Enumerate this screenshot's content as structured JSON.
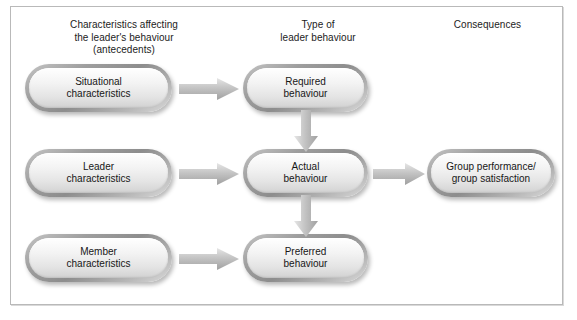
{
  "diagram": {
    "columns": [
      {
        "id": "antecedents",
        "label": "Characteristics affecting\nthe leader's behaviour\n(antecedents)"
      },
      {
        "id": "behaviour",
        "label": "Type of\nleader behaviour"
      },
      {
        "id": "consequences",
        "label": "Consequences"
      }
    ],
    "nodes": [
      {
        "id": "situational",
        "label": "Situational\ncharacteristics"
      },
      {
        "id": "leader",
        "label": "Leader\ncharacteristics"
      },
      {
        "id": "member",
        "label": "Member\ncharacteristics"
      },
      {
        "id": "required",
        "label": "Required\nbehaviour"
      },
      {
        "id": "actual",
        "label": "Actual\nbehaviour"
      },
      {
        "id": "preferred",
        "label": "Preferred\nbehaviour"
      },
      {
        "id": "group",
        "label": "Group performance/\ngroup satisfaction"
      }
    ],
    "arrows": [
      {
        "id": "situational-required",
        "from": "situational",
        "to": "required",
        "direction": "right"
      },
      {
        "id": "leader-actual",
        "from": "leader",
        "to": "actual",
        "direction": "right"
      },
      {
        "id": "member-preferred",
        "from": "member",
        "to": "preferred",
        "direction": "right"
      },
      {
        "id": "actual-group",
        "from": "actual",
        "to": "group",
        "direction": "right"
      },
      {
        "id": "required-actual",
        "from": "required",
        "to": "actual",
        "direction": "down"
      },
      {
        "id": "actual-preferred",
        "from": "actual",
        "to": "preferred",
        "direction": "down"
      }
    ],
    "colors": {
      "frame_border": "#b9b9b9",
      "node_fill_light": "#ffffff",
      "node_fill_dark": "#d2d2d2",
      "node_bevel": "#8d8d8d",
      "arrow_fill": "#b0b0b0",
      "text": "#171717",
      "background": "#ffffff"
    }
  }
}
